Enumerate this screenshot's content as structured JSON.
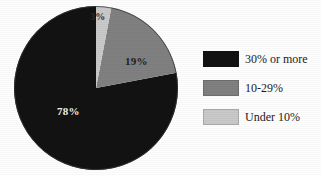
{
  "chart_data": {
    "type": "pie",
    "title": "",
    "subtitle": "",
    "xlabel": "",
    "ylabel": "",
    "grid": false,
    "legend_position": "right",
    "start_angle_deg": 0,
    "direction": "clockwise",
    "categories": [
      "30% or more",
      "10-29%",
      "Under 10%"
    ],
    "values": [
      78,
      19,
      3
    ],
    "value_unit": "%",
    "data_labels": [
      "78%",
      "19%",
      "3%"
    ],
    "colors": [
      "#121212",
      "#808080",
      "#c9c9c9"
    ],
    "slices": [
      {
        "label": "30% or more",
        "value": 78,
        "display": "78%",
        "color": "#121212",
        "label_color": "#f2f2f2"
      },
      {
        "label": "10-29%",
        "value": 19,
        "display": "19%",
        "color": "#808080",
        "label_color": "#1e1e1e"
      },
      {
        "label": "Under 10%",
        "value": 3,
        "display": "3%",
        "color": "#c9c9c9",
        "label_color": "#2b2b2b"
      }
    ]
  },
  "pie": {
    "labels": {
      "under10": "3%",
      "range10to29": "19%",
      "thirty_or_more": "78%"
    }
  },
  "legend": {
    "items": [
      {
        "label": "30% or more",
        "swatch": "#121212"
      },
      {
        "label": "10-29%",
        "swatch": "#808080"
      },
      {
        "label": "Under 10%",
        "swatch": "#c9c9c9"
      }
    ]
  },
  "colors": {
    "dark": "#121212",
    "mid": "#808080",
    "light": "#c9c9c9",
    "background": "#ffffff"
  }
}
